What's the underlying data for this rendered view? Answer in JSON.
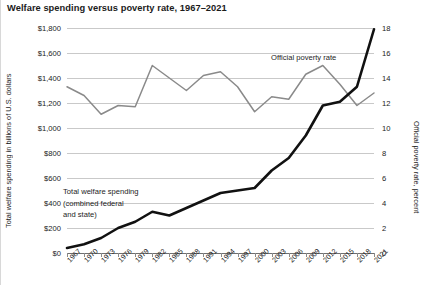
{
  "chart_data": {
    "type": "line",
    "title": "Welfare spending versus poverty rate, 1967–2021",
    "xlabel": "",
    "ylabel": "Total welfare spending in billions of U.S. dollars",
    "y2label": "Official poverty rate, percent",
    "grid": true,
    "legend_position": "inline-annotations",
    "xlim": [
      1967,
      2021
    ],
    "ylim": [
      0,
      1800
    ],
    "y2lim": [
      0,
      18
    ],
    "yticks": [
      "$0",
      "$200",
      "$400",
      "$600",
      "$800",
      "$1,000",
      "$1,200",
      "$1,400",
      "$1,600",
      "$1,800"
    ],
    "ytick_values": [
      0,
      200,
      400,
      600,
      800,
      1000,
      1200,
      1400,
      1600,
      1800
    ],
    "y2ticks": [
      "0",
      "2",
      "4",
      "6",
      "8",
      "10",
      "12",
      "14",
      "16",
      "18"
    ],
    "y2tick_values": [
      0,
      2,
      4,
      6,
      8,
      10,
      12,
      14,
      16,
      18
    ],
    "xticks": [
      "1967",
      "1970",
      "1973",
      "1976",
      "1979",
      "1982",
      "1985",
      "1988",
      "1991",
      "1994",
      "1997",
      "2000",
      "2003",
      "2006",
      "2009",
      "2012",
      "2015",
      "2018",
      "2021"
    ],
    "xtick_values": [
      1967,
      1970,
      1973,
      1976,
      1979,
      1982,
      1985,
      1988,
      1991,
      1994,
      1997,
      2000,
      2003,
      2006,
      2009,
      2012,
      2015,
      2018,
      2021
    ],
    "annotations": [
      {
        "name": "welfare-spending-label",
        "lines": [
          "Total welfare spending",
          "(combined federal",
          "and state)"
        ],
        "text": "Total welfare spending (combined federal and state)"
      },
      {
        "name": "poverty-rate-label",
        "lines": [
          "Official poverty rate"
        ],
        "text": "Official poverty rate"
      }
    ],
    "series": [
      {
        "name": "Total welfare spending (combined federal and state)",
        "axis": "left",
        "color": "#111111",
        "width": 2.6,
        "unit": "billions of U.S. dollars",
        "x": [
          1967,
          1970,
          1973,
          1976,
          1979,
          1982,
          1985,
          1988,
          1991,
          1994,
          1997,
          2000,
          2003,
          2006,
          2009,
          2012,
          2015,
          2018,
          2021
        ],
        "values": [
          40,
          70,
          120,
          200,
          250,
          330,
          300,
          360,
          420,
          480,
          500,
          520,
          660,
          760,
          940,
          1180,
          1210,
          1330,
          1790
        ]
      },
      {
        "name": "Official poverty rate",
        "axis": "right",
        "color": "#8a8a8a",
        "width": 1.5,
        "unit": "percent",
        "x": [
          1967,
          1970,
          1973,
          1976,
          1979,
          1982,
          1985,
          1988,
          1991,
          1994,
          1997,
          2000,
          2003,
          2006,
          2009,
          2012,
          2015,
          2018,
          2021
        ],
        "values": [
          13.3,
          12.6,
          11.1,
          11.8,
          11.7,
          15.0,
          14.0,
          13.0,
          14.2,
          14.5,
          13.3,
          11.3,
          12.5,
          12.3,
          14.3,
          15.0,
          13.5,
          11.8,
          12.8
        ]
      }
    ]
  },
  "axis_titles": {
    "left": "Total welfare spending in billions of U.S. dollars",
    "right": "Official poverty rate, percent"
  }
}
